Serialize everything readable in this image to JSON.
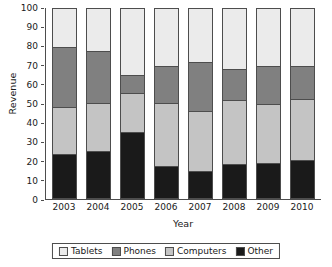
{
  "chart_data": {
    "type": "bar",
    "subtype": "stacked-bar-100-percent",
    "title": "",
    "xlabel": "Year",
    "ylabel": "Revenue",
    "categories": [
      "2003",
      "2004",
      "2005",
      "2006",
      "2007",
      "2008",
      "2009",
      "2010"
    ],
    "ylim": [
      0,
      100
    ],
    "yticks": [
      0,
      10,
      20,
      30,
      40,
      50,
      60,
      70,
      80,
      90,
      100
    ],
    "grid": false,
    "legend_position": "bottom",
    "stack_order_bottom_to_top": [
      "Other",
      "Computers",
      "Phones",
      "Tablets"
    ],
    "series": [
      {
        "name": "Other",
        "color": "#1a1a1a",
        "values": [
          23.5,
          25,
          35,
          17,
          14.5,
          18,
          18.5,
          20
        ]
      },
      {
        "name": "Computers",
        "color": "#c4c4c4",
        "values": [
          24.5,
          25,
          20.5,
          33,
          31.5,
          34,
          31,
          32.5
        ]
      },
      {
        "name": "Phones",
        "color": "#808080",
        "values": [
          32,
          28,
          9.5,
          20,
          26,
          16.5,
          20.5,
          17.5
        ]
      },
      {
        "name": "Tablets",
        "color": "#ebebeb",
        "values": [
          20,
          22,
          35,
          30,
          28,
          31.5,
          30,
          30
        ]
      }
    ],
    "cumulative_tops": {
      "2003": {
        "Other": 23.5,
        "Computers": 48,
        "Phones": 80,
        "Tablets": 100
      },
      "2004": {
        "Other": 25,
        "Computers": 50,
        "Phones": 78,
        "Tablets": 100
      },
      "2005": {
        "Other": 35,
        "Computers": 55.5,
        "Phones": 65,
        "Tablets": 100
      },
      "2006": {
        "Other": 17,
        "Computers": 50,
        "Phones": 70,
        "Tablets": 100
      },
      "2007": {
        "Other": 14.5,
        "Computers": 46,
        "Phones": 72,
        "Tablets": 100
      },
      "2008": {
        "Other": 18,
        "Computers": 52,
        "Phones": 68.5,
        "Tablets": 100
      },
      "2009": {
        "Other": 18.5,
        "Computers": 49.5,
        "Phones": 70,
        "Tablets": 100
      },
      "2010": {
        "Other": 20,
        "Computers": 52.5,
        "Phones": 70,
        "Tablets": 100
      }
    }
  },
  "axes": {
    "y_title": "Revenue",
    "x_title": "Year",
    "y_tick_labels": [
      "100",
      "90",
      "80",
      "70",
      "60",
      "50",
      "40",
      "30",
      "20",
      "10",
      "0"
    ],
    "x_tick_labels": [
      "2003",
      "2004",
      "2005",
      "2006",
      "2007",
      "2008",
      "2009",
      "2010"
    ]
  },
  "legend": {
    "items": [
      {
        "label": "Tablets",
        "color": "#ebebeb"
      },
      {
        "label": "Phones",
        "color": "#808080"
      },
      {
        "label": "Computers",
        "color": "#c4c4c4"
      },
      {
        "label": "Other",
        "color": "#1a1a1a"
      }
    ]
  },
  "style": {
    "axis_color": "#4d4d4d",
    "background": "#ffffff",
    "text_color": "#1a1a1a"
  }
}
